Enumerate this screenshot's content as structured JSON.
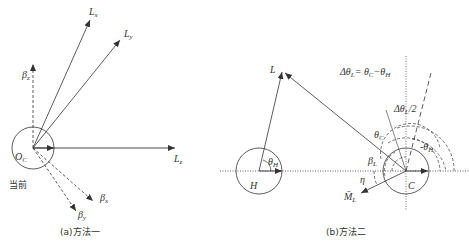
{
  "diagram_a": {
    "caption": "(a)方法一",
    "current_label": "当前",
    "origin_label": "O_C",
    "labels": {
      "Lx": "Lx",
      "Ly": "Ly",
      "Lz": "Lz",
      "beta_z": "βz",
      "beta_x": "βx",
      "beta_y": "βy"
    }
  },
  "diagram_b": {
    "caption": "(b)方法二",
    "equation": "ΔθL= θC−θH",
    "labels": {
      "L": "L",
      "H": "H",
      "C": "C",
      "theta_H_left": "θH",
      "theta_C": "θC",
      "beta_L": "βL",
      "eta": "η",
      "M_L": "M̄L",
      "delta_theta_half": "ΔθL/2",
      "theta_H_right": "-θH"
    }
  },
  "colors": {
    "line": "#333333",
    "background": "#ffffff"
  }
}
